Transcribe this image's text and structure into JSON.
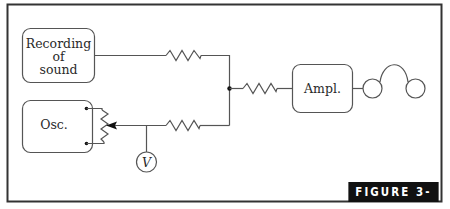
{
  "figure": {
    "label": "FIGURE 3-18",
    "colors": {
      "frame": "#333333",
      "line": "#555555",
      "text": "#2a2a2a",
      "label_bg": "#111111",
      "label_fg": "#ffffff"
    }
  },
  "components": {
    "recording": {
      "label_lines": [
        "Recording",
        "of",
        "sound"
      ]
    },
    "oscillator": {
      "label": "Osc."
    },
    "amplifier": {
      "label": "Ampl."
    },
    "voltmeter": {
      "label": "V"
    },
    "headphones": {
      "label": ""
    },
    "resistors": [
      {
        "id": "r1",
        "position": "top-left branch"
      },
      {
        "id": "r2",
        "position": "bottom-left branch"
      },
      {
        "id": "r3",
        "position": "to amplifier"
      }
    ],
    "potentiometer": {
      "label": ""
    }
  }
}
